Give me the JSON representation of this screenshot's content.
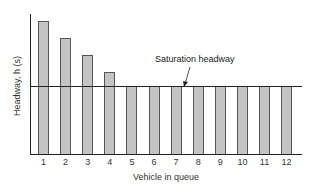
{
  "chart_data": {
    "type": "bar",
    "title": "",
    "xlabel": "Vehicle in queue",
    "ylabel": "Headway, h (s)",
    "categories": [
      "1",
      "2",
      "3",
      "4",
      "5",
      "6",
      "7",
      "8",
      "9",
      "10",
      "11",
      "12"
    ],
    "values": [
      7.8,
      6.8,
      5.8,
      4.8,
      4.0,
      4.0,
      4.0,
      4.0,
      4.0,
      4.0,
      4.0,
      4.0
    ],
    "value_units": "relative (no numeric y ticks shown)",
    "saturation_headway": 4.0,
    "ylim": [
      0,
      8.2
    ],
    "grid": false,
    "legend": null,
    "annotations": [
      {
        "text": "Saturation headway",
        "points_to": "horizontal line at saturation headway level"
      }
    ],
    "bar_color": "#c4c4c4",
    "bar_edge_color": "#555555"
  },
  "labels": {
    "xlabel": "Vehicle in queue",
    "ylabel": "Headway, h (s)",
    "annotation": "Saturation headway"
  }
}
